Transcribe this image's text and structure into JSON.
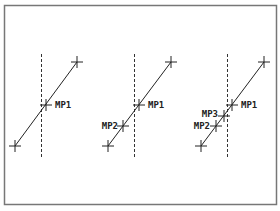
{
  "frame": {
    "x": 4,
    "y": 5,
    "width": 272,
    "height": 199,
    "stroke": "#777777"
  },
  "colors": {
    "line": "#222222",
    "dashed": "#333333"
  },
  "panels": [
    {
      "name": "panel-1",
      "divider_x": 41,
      "divider_y1": 54,
      "divider_y2": 157,
      "line": {
        "x1": 15,
        "y1": 146,
        "x2": 77,
        "y2": 62
      },
      "endpoints": [
        {
          "x": 15,
          "y": 146
        },
        {
          "x": 77,
          "y": 62
        }
      ],
      "points": [
        {
          "label": "MP1",
          "x": 46,
          "y": 105,
          "lx": 55,
          "ly": 108,
          "anchor": "start"
        }
      ]
    },
    {
      "name": "panel-2",
      "divider_x": 134,
      "divider_y1": 54,
      "divider_y2": 157,
      "line": {
        "x1": 108,
        "y1": 146,
        "x2": 171,
        "y2": 62
      },
      "endpoints": [
        {
          "x": 108,
          "y": 146
        },
        {
          "x": 171,
          "y": 62
        }
      ],
      "points": [
        {
          "label": "MP1",
          "x": 139,
          "y": 105,
          "lx": 148,
          "ly": 108,
          "anchor": "start"
        },
        {
          "label": "MP2",
          "x": 123,
          "y": 126,
          "lx": 118,
          "ly": 129,
          "anchor": "end"
        }
      ]
    },
    {
      "name": "panel-3",
      "divider_x": 227,
      "divider_y1": 54,
      "divider_y2": 157,
      "line": {
        "x1": 201,
        "y1": 146,
        "x2": 264,
        "y2": 62
      },
      "endpoints": [
        {
          "x": 201,
          "y": 146
        },
        {
          "x": 264,
          "y": 62
        }
      ],
      "points": [
        {
          "label": "MP1",
          "x": 232,
          "y": 105,
          "lx": 241,
          "ly": 108,
          "anchor": "start"
        },
        {
          "label": "MP3",
          "x": 224,
          "y": 116,
          "lx": 218,
          "ly": 117,
          "anchor": "end"
        },
        {
          "label": "MP2",
          "x": 216,
          "y": 126,
          "lx": 210,
          "ly": 129,
          "anchor": "end"
        }
      ]
    }
  ]
}
